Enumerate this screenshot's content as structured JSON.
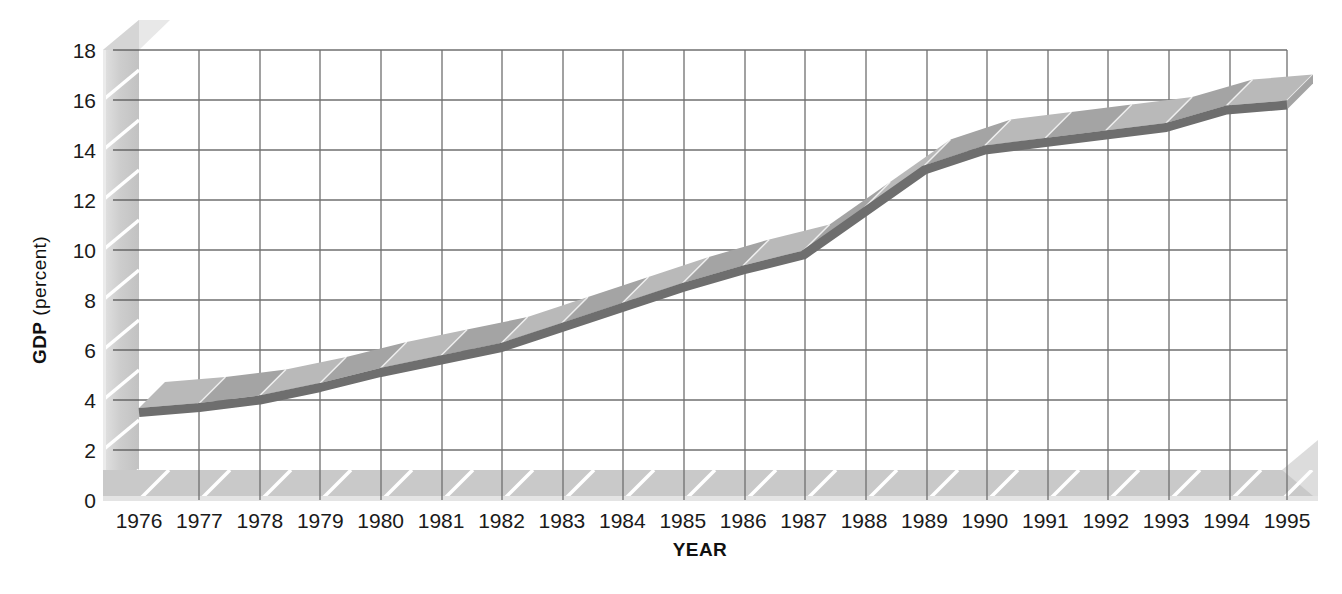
{
  "chart_data": {
    "type": "line",
    "title": "",
    "xlabel": "YEAR",
    "ylabel_bold": "GDP",
    "ylabel_regular": "(percent)",
    "ylabel_full": "GDP (percent)",
    "categories": [
      "1976",
      "1977",
      "1978",
      "1979",
      "1980",
      "1981",
      "1982",
      "1983",
      "1984",
      "1985",
      "1986",
      "1987",
      "1988",
      "1989",
      "1990",
      "1991",
      "1992",
      "1993",
      "1994",
      "1995"
    ],
    "x": [
      1976,
      1977,
      1978,
      1979,
      1980,
      1981,
      1982,
      1983,
      1984,
      1985,
      1986,
      1987,
      1988,
      1989,
      1990,
      1991,
      1992,
      1993,
      1994,
      1995
    ],
    "values": [
      3.5,
      3.7,
      4.0,
      4.5,
      5.1,
      5.6,
      6.1,
      6.9,
      7.7,
      8.5,
      9.2,
      9.8,
      11.5,
      13.2,
      14.0,
      14.3,
      14.6,
      14.9,
      15.6,
      15.8
    ],
    "series": [
      {
        "name": "GDP",
        "values": [
          3.5,
          3.7,
          4.0,
          4.5,
          5.1,
          5.6,
          6.1,
          6.9,
          7.7,
          8.5,
          9.2,
          9.8,
          11.5,
          13.2,
          14.0,
          14.3,
          14.6,
          14.9,
          15.6,
          15.8
        ]
      }
    ],
    "y_ticks": [
      0,
      2,
      4,
      6,
      8,
      10,
      12,
      14,
      16,
      18
    ],
    "y_tick_labels": [
      "0",
      "2",
      "4",
      "6",
      "8",
      "10",
      "12",
      "14",
      "16",
      "18"
    ],
    "ylim": [
      0,
      18
    ],
    "xlim": [
      1976,
      1995
    ],
    "grid": true,
    "legend": "none",
    "style": "3d-ribbon-line",
    "colors": {
      "line_dark": "#6e6e6e",
      "ribbon_light": "#b9b9b9",
      "ribbon_mid": "#a4a4a4",
      "ribbon_top": "#cfcfcf",
      "grid": "#6f6f6f",
      "axis_face": "#c9c9c9",
      "axis_light": "#dedede",
      "axis_shadow": "#b0b0b0",
      "background": "#ffffff",
      "text": "#1a1a1a"
    }
  }
}
